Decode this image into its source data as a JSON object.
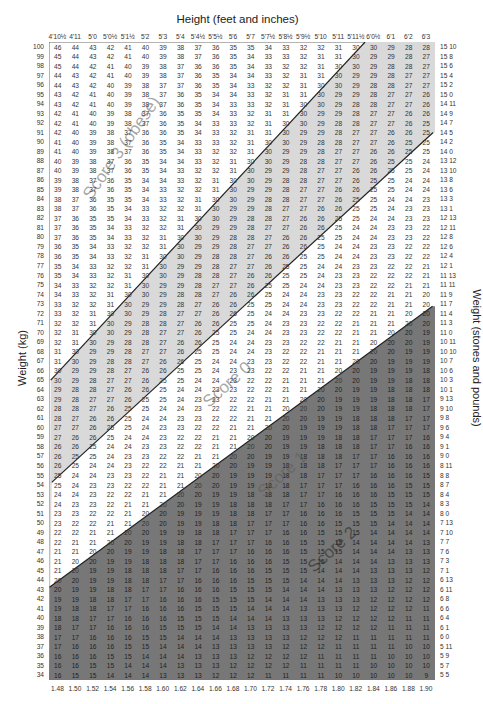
{
  "chart_data": {
    "type": "table",
    "title": "Height (feet and inches)",
    "xlabel_bottom": "Height (m)",
    "ylabel": "Weight (kg)",
    "ylabel_right": "Weight (stones and pounds)",
    "columns_ft_in": [
      "4'10½",
      "4'11",
      "5'0",
      "5'0½",
      "5'1½",
      "5'2",
      "5'3",
      "5'4",
      "5'4½",
      "5'5½",
      "5'6",
      "5'7",
      "5'7½",
      "5'8½",
      "5'9½",
      "5'10",
      "5'11",
      "5'11½",
      "6'0½",
      "6'1",
      "6'2",
      "6'3"
    ],
    "columns_m": [
      "1.48",
      "1.50",
      "1.52",
      "1.54",
      "1.56",
      "1.58",
      "1.60",
      "1.62",
      "1.64",
      "1.66",
      "1.68",
      "1.70",
      "1.72",
      "1.74",
      "1.76",
      "1.78",
      "1.80",
      "1.82",
      "1.84",
      "1.86",
      "1.88",
      "1.90"
    ],
    "rows_kg": [
      100,
      99,
      98,
      97,
      96,
      95,
      94,
      93,
      92,
      91,
      90,
      89,
      88,
      87,
      86,
      85,
      84,
      83,
      82,
      81,
      80,
      79,
      78,
      77,
      76,
      75,
      74,
      73,
      72,
      71,
      70,
      69,
      68,
      67,
      66,
      65,
      64,
      63,
      62,
      61,
      60,
      59,
      58,
      57,
      56,
      55,
      54,
      53,
      52,
      51,
      50,
      49,
      48,
      47,
      46,
      45,
      44,
      43,
      42,
      41,
      40,
      39,
      38,
      37,
      36,
      35,
      34
    ],
    "rows_st_lb": [
      "15 10",
      "15 8",
      "15 6",
      "15 4",
      "15 2",
      "15 0",
      "14 11",
      "14 9",
      "14 7",
      "14 5",
      "14 2",
      "14 0",
      "13 12",
      "13 10",
      "13 8",
      "13 6",
      "13 3",
      "13 1",
      "12 13",
      "12 11",
      "12 8",
      "12 6",
      "12 4",
      "12 1",
      "11 13",
      "11 11",
      "11 9",
      "11 7",
      "11 4",
      "11 3",
      "11 0",
      "10 11",
      "10 10",
      "10 7",
      "10 6",
      "10 3",
      "10 1",
      "9 13",
      "9 10",
      "9 8",
      "9 6",
      "9 4",
      "9 1",
      "9 0",
      "8 11",
      "8 8",
      "8 7",
      "8 4",
      "8 3",
      "8 0",
      "7 13",
      "7 10",
      "7 7",
      "7 6",
      "7 3",
      "7 1",
      "6 13",
      "6 11",
      "6 8",
      "6 6",
      "6 4",
      "6 1",
      "6 0",
      "5 11",
      "5 9",
      "5 7",
      "5 5"
    ],
    "cell_value": "BMI = weight_kg / height_m^2, rounded",
    "zones": [
      {
        "label": "Score 3 (obese)",
        "bmi_range": ">30",
        "fill": "#ffffff"
      },
      {
        "label": "Score 0",
        "bmi_range": "25-30",
        "fill": "#d9d9d9"
      },
      {
        "label": "Score 1",
        "bmi_range": "20-25 boundary band",
        "fill": "#ffffff"
      },
      {
        "label": "Score 2",
        "bmi_range": "<20",
        "fill": "#7a7a7a"
      }
    ]
  },
  "labels": {
    "title": "Height (feet and inches)",
    "ylabel_left": "Weight (kg)",
    "ylabel_right": "Weight (stones and pounds)",
    "score3": "Score 3 (obese)",
    "score0": "Score 0",
    "score1": "Score 1",
    "score2": "Score 2"
  }
}
